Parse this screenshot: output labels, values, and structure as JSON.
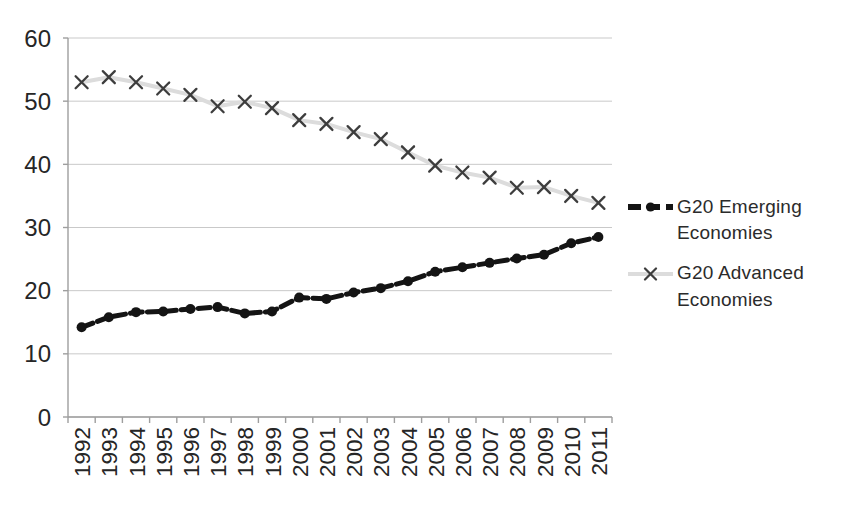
{
  "chart_data": {
    "type": "line",
    "title": "",
    "xlabel": "",
    "ylabel": "",
    "categories": [
      "1992",
      "1993",
      "1994",
      "1995",
      "1996",
      "1997",
      "1998",
      "1999",
      "2000",
      "2001",
      "2002",
      "2003",
      "2004",
      "2005",
      "2006",
      "2007",
      "2008",
      "2009",
      "2010",
      "2011"
    ],
    "series": [
      {
        "name": "G20 Emerging Economies",
        "values": [
          14.2,
          15.8,
          16.6,
          16.7,
          17.1,
          17.4,
          16.4,
          16.7,
          18.9,
          18.7,
          19.7,
          20.4,
          21.5,
          23.0,
          23.7,
          24.4,
          25.1,
          25.7,
          27.5,
          28.5
        ],
        "color": "#141414",
        "line_style": "dashed",
        "marker": "dot",
        "marker_color": "#141414"
      },
      {
        "name": "G20 Advanced Economies",
        "values": [
          53.0,
          53.8,
          53.0,
          52.0,
          51.0,
          49.2,
          49.9,
          48.9,
          47.0,
          46.4,
          45.1,
          44.0,
          41.9,
          39.8,
          38.7,
          37.9,
          36.3,
          36.4,
          35.0,
          33.9
        ],
        "color": "#dcdcdc",
        "line_style": "solid",
        "marker": "x",
        "marker_color": "#3d3d3d"
      }
    ],
    "ylim": [
      0,
      60
    ],
    "ytick_step": 10,
    "grid": true,
    "gridline_color": "#c9c9c9",
    "axis_color": "#9e9e9e",
    "tick_label_color": "#262626",
    "legend_position": "right"
  }
}
